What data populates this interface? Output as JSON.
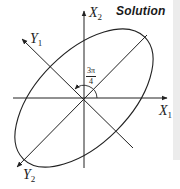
{
  "header": {
    "title": "Solution"
  },
  "axes": {
    "x1": {
      "label": "X",
      "sub": "1"
    },
    "x2": {
      "label": "X",
      "sub": "2"
    },
    "y1": {
      "label": "Y",
      "sub": "1"
    },
    "y2": {
      "label": "Y",
      "sub": "2"
    }
  },
  "angle": {
    "numerator": "3π",
    "denominator": "4"
  },
  "colors": {
    "line": "#222222",
    "strip": "#ececec",
    "background": "#ffffff"
  }
}
